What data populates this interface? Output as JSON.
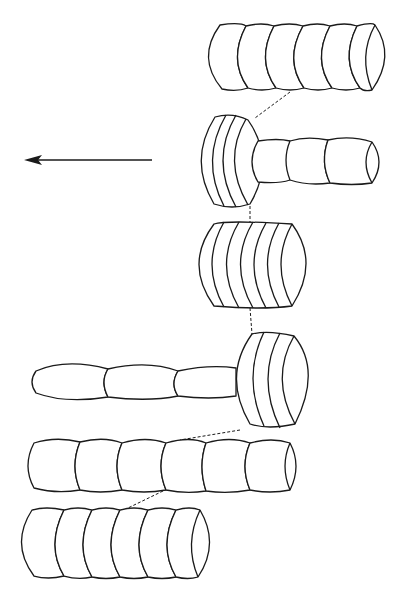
{
  "figure": {
    "colors": {
      "stroke": "#1a1a1a",
      "background": "#ffffff"
    },
    "arrow": {
      "direction": "left",
      "icon": "arrow-left-icon"
    },
    "stages": [
      {
        "id": 1,
        "shape": "cylinder-segments",
        "segment_count": 6
      },
      {
        "id": 2,
        "shape": "compressed-disc-stack-with-stalk",
        "disc_count": 4,
        "stalk_segment_count": 3
      },
      {
        "id": 3,
        "shape": "compressed-disc-stack",
        "disc_count": 6
      },
      {
        "id": 4,
        "shape": "compressed-disc-stack-with-stalk",
        "disc_count": 3,
        "stalk_segment_count": 3
      },
      {
        "id": 5,
        "shape": "cylinder-segments",
        "segment_count": 6
      },
      {
        "id": 6,
        "shape": "cylinder-segments",
        "segment_count": 6
      }
    ]
  }
}
